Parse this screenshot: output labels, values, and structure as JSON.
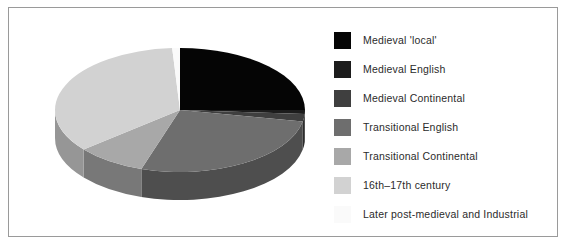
{
  "figure": {
    "background_color": "#ffffff",
    "border_color": "#9a9a9a"
  },
  "chart_data": {
    "type": "pie",
    "title": "",
    "subtitle": "",
    "xlabel": "",
    "ylabel": "",
    "three_d": true,
    "start_angle_oclock": 12,
    "direction": "clockwise",
    "legend_position": "right",
    "grid": false,
    "categories": [
      "Medieval 'local'",
      "Medieval English",
      "Medieval Continental",
      "Transitional English",
      "Transitional Continental",
      "16th–17th century",
      "Later post-medieval and Industrial"
    ],
    "values": [
      25,
      1,
      2,
      27,
      9,
      35,
      1
    ],
    "colors": [
      "#050505",
      "#1c1c1c",
      "#3f3f3f",
      "#6e6e6e",
      "#a8a8a8",
      "#d2d2d2",
      "#fafafa"
    ],
    "side_colors": [
      "#020202",
      "#121212",
      "#2c2c2c",
      "#4e4e4e",
      "#787878",
      "#969696",
      "#b4b4b4"
    ]
  },
  "legend": {
    "items": [
      {
        "label": "Medieval 'local'",
        "color": "#050505"
      },
      {
        "label": "Medieval English",
        "color": "#1c1c1c"
      },
      {
        "label": "Medieval Continental",
        "color": "#3f3f3f"
      },
      {
        "label": "Transitional English",
        "color": "#6e6e6e"
      },
      {
        "label": "Transitional Continental",
        "color": "#a8a8a8"
      },
      {
        "label": "16th–17th century",
        "color": "#d2d2d2"
      },
      {
        "label": "Later post-medieval and Industrial",
        "color": "#fafafa"
      }
    ]
  }
}
